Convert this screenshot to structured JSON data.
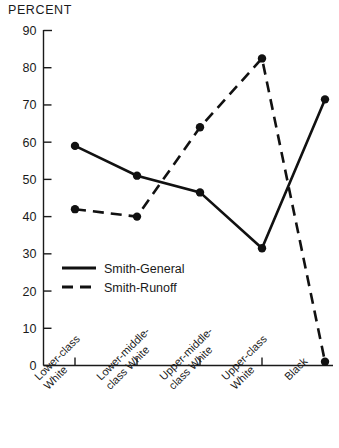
{
  "chart_data": {
    "type": "line",
    "title": "PERCENT",
    "ylabel": "PERCENT",
    "xlabel": "",
    "ylim": [
      0,
      90
    ],
    "yticks": [
      0,
      10,
      20,
      30,
      40,
      50,
      60,
      70,
      80,
      90
    ],
    "grid": false,
    "legend_position": "inside-lower-left",
    "categories": [
      "Lower-class White",
      "Lower-middle-class White",
      "Upper-middle-class White",
      "Upper-class White",
      "Black"
    ],
    "category_lines": [
      [
        "Lower-class",
        "White"
      ],
      [
        "Lower-middle-",
        "class White"
      ],
      [
        "Upper-middle-",
        "class White"
      ],
      [
        "Upper-class",
        "White"
      ],
      [
        "Black"
      ]
    ],
    "series": [
      {
        "name": "Smith-General",
        "style": "solid",
        "color": "#111111",
        "values": [
          59,
          51,
          46.5,
          31.5,
          71.5
        ]
      },
      {
        "name": "Smith-Runoff",
        "style": "dashed",
        "color": "#111111",
        "values": [
          42,
          40,
          64,
          82.5,
          1
        ]
      }
    ]
  },
  "legend": {
    "items": [
      {
        "label": "Smith-General",
        "style": "solid"
      },
      {
        "label": "Smith-Runoff",
        "style": "dashed"
      }
    ]
  }
}
